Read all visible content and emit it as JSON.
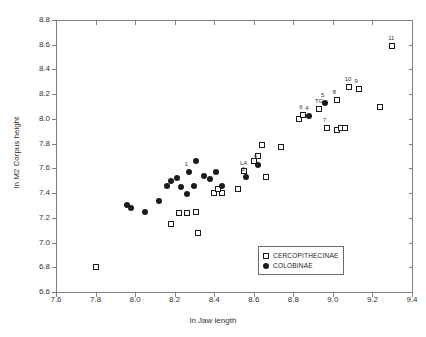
{
  "chart_data": {
    "type": "scatter",
    "title": "",
    "xlabel": "ln Jaw length",
    "ylabel": "ln M2 Corpus height",
    "xlim": [
      7.6,
      9.4
    ],
    "ylim": [
      6.6,
      8.8
    ],
    "xticks": [
      "7.6",
      "7.8",
      "8.0",
      "8.2",
      "8.4",
      "8.6",
      "8.8",
      "9.0",
      "9.2",
      "9.4"
    ],
    "yticks": [
      "6.6",
      "6.8",
      "7.0",
      "7.2",
      "7.4",
      "7.6",
      "7.8",
      "8.0",
      "8.2",
      "8.4",
      "8.6",
      "8.8"
    ],
    "grid": false,
    "legend_position": "lower-right",
    "series": [
      {
        "name": "CERCOPITHECINAE",
        "marker": "open-square",
        "points": [
          {
            "x": 7.8,
            "y": 6.8,
            "label": ""
          },
          {
            "x": 8.22,
            "y": 7.24,
            "label": ""
          },
          {
            "x": 8.26,
            "y": 7.24,
            "label": ""
          },
          {
            "x": 8.31,
            "y": 7.25,
            "label": ""
          },
          {
            "x": 8.18,
            "y": 7.15,
            "label": ""
          },
          {
            "x": 8.32,
            "y": 7.08,
            "label": ""
          },
          {
            "x": 8.4,
            "y": 7.4,
            "label": ""
          },
          {
            "x": 8.44,
            "y": 7.4,
            "label": ""
          },
          {
            "x": 8.42,
            "y": 7.43,
            "label": ""
          },
          {
            "x": 8.52,
            "y": 7.43,
            "label": ""
          },
          {
            "x": 8.55,
            "y": 7.58,
            "label": "LA"
          },
          {
            "x": 8.6,
            "y": 7.66,
            "label": ""
          },
          {
            "x": 8.62,
            "y": 7.7,
            "label": ""
          },
          {
            "x": 8.66,
            "y": 7.53,
            "label": ""
          },
          {
            "x": 8.64,
            "y": 7.79,
            "label": ""
          },
          {
            "x": 8.74,
            "y": 7.77,
            "label": ""
          },
          {
            "x": 8.83,
            "y": 8.0,
            "label": ""
          },
          {
            "x": 8.85,
            "y": 8.03,
            "label": "6"
          },
          {
            "x": 8.93,
            "y": 8.08,
            "label": "TG"
          },
          {
            "x": 8.97,
            "y": 7.93,
            "label": "7"
          },
          {
            "x": 9.02,
            "y": 7.91,
            "label": ""
          },
          {
            "x": 9.04,
            "y": 7.93,
            "label": ""
          },
          {
            "x": 9.06,
            "y": 7.93,
            "label": ""
          },
          {
            "x": 9.02,
            "y": 8.15,
            "label": "8"
          },
          {
            "x": 9.08,
            "y": 8.26,
            "label": "10"
          },
          {
            "x": 9.13,
            "y": 8.24,
            "label": "9"
          },
          {
            "x": 9.24,
            "y": 8.1,
            "label": ""
          },
          {
            "x": 9.3,
            "y": 8.59,
            "label": "11"
          }
        ]
      },
      {
        "name": "COLOBINAE",
        "marker": "filled-circle",
        "points": [
          {
            "x": 7.96,
            "y": 7.3,
            "label": ""
          },
          {
            "x": 7.98,
            "y": 7.28,
            "label": ""
          },
          {
            "x": 8.05,
            "y": 7.25,
            "label": ""
          },
          {
            "x": 8.12,
            "y": 7.34,
            "label": ""
          },
          {
            "x": 8.18,
            "y": 7.5,
            "label": ""
          },
          {
            "x": 8.21,
            "y": 7.52,
            "label": ""
          },
          {
            "x": 8.16,
            "y": 7.46,
            "label": ""
          },
          {
            "x": 8.23,
            "y": 7.45,
            "label": ""
          },
          {
            "x": 8.26,
            "y": 7.39,
            "label": ""
          },
          {
            "x": 8.27,
            "y": 7.57,
            "label": "1"
          },
          {
            "x": 8.31,
            "y": 7.66,
            "label": ""
          },
          {
            "x": 8.3,
            "y": 7.46,
            "label": ""
          },
          {
            "x": 8.35,
            "y": 7.54,
            "label": ""
          },
          {
            "x": 8.38,
            "y": 7.51,
            "label": ""
          },
          {
            "x": 8.41,
            "y": 7.57,
            "label": ""
          },
          {
            "x": 8.44,
            "y": 7.46,
            "label": ""
          },
          {
            "x": 8.56,
            "y": 7.53,
            "label": "2"
          },
          {
            "x": 8.62,
            "y": 7.63,
            "label": "3"
          },
          {
            "x": 8.88,
            "y": 8.02,
            "label": "4"
          },
          {
            "x": 8.96,
            "y": 8.13,
            "label": "5"
          }
        ]
      }
    ]
  },
  "legend": {
    "items": [
      {
        "label": "CERCOPITHECINAE",
        "marker": "open-square"
      },
      {
        "label": "COLOBINAE",
        "marker": "filled-circle"
      }
    ]
  }
}
